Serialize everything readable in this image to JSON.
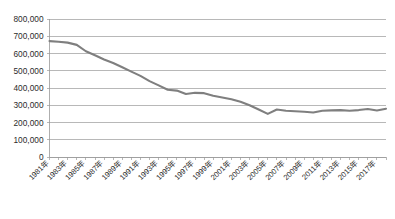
{
  "chart_data": {
    "type": "line",
    "title": "",
    "subtitle": "",
    "xlabel": "",
    "ylabel": "",
    "ylim": [
      0,
      800000
    ],
    "ytick_values": [
      0,
      100000,
      200000,
      300000,
      400000,
      500000,
      600000,
      700000,
      800000
    ],
    "ytick_labels": [
      "0",
      "100,000",
      "200,000",
      "300,000",
      "400,000",
      "500,000",
      "600,000",
      "700,000",
      "800,000"
    ],
    "grid": true,
    "legend": false,
    "legend_position": "none",
    "x": [
      "1981年",
      "1982年",
      "1983年",
      "1984年",
      "1985年",
      "1986年",
      "1987年",
      "1988年",
      "1989年",
      "1990年",
      "1991年",
      "1992年",
      "1993年",
      "1994年",
      "1995年",
      "1996年",
      "1997年",
      "1998年",
      "1999年",
      "2000年",
      "2001年",
      "2002年",
      "2003年",
      "2004年",
      "2005年",
      "2006年",
      "2007年",
      "2008年",
      "2009年",
      "2010年",
      "2011年",
      "2012年",
      "2013年",
      "2014年",
      "2015年",
      "2016年",
      "2017年",
      "2018年"
    ],
    "xtick_labels_shown": [
      "1981年",
      "1983年",
      "1985年",
      "1987年",
      "1989年",
      "1991年",
      "1993年",
      "1995年",
      "1997年",
      "1999年",
      "2001年",
      "2003年",
      "2005年",
      "2007年",
      "2009年",
      "2011年",
      "2013年",
      "2015年",
      "2017年"
    ],
    "series": [
      {
        "name": "",
        "color": "#7f7f7f",
        "values": [
          672000,
          668000,
          663000,
          650000,
          613000,
          590000,
          565000,
          545000,
          520000,
          495000,
          470000,
          440000,
          415000,
          390000,
          385000,
          365000,
          372000,
          370000,
          355000,
          345000,
          335000,
          320000,
          300000,
          275000,
          250000,
          275000,
          268000,
          265000,
          262000,
          258000,
          268000,
          270000,
          272000,
          268000,
          272000,
          278000,
          270000,
          280000
        ]
      }
    ]
  }
}
